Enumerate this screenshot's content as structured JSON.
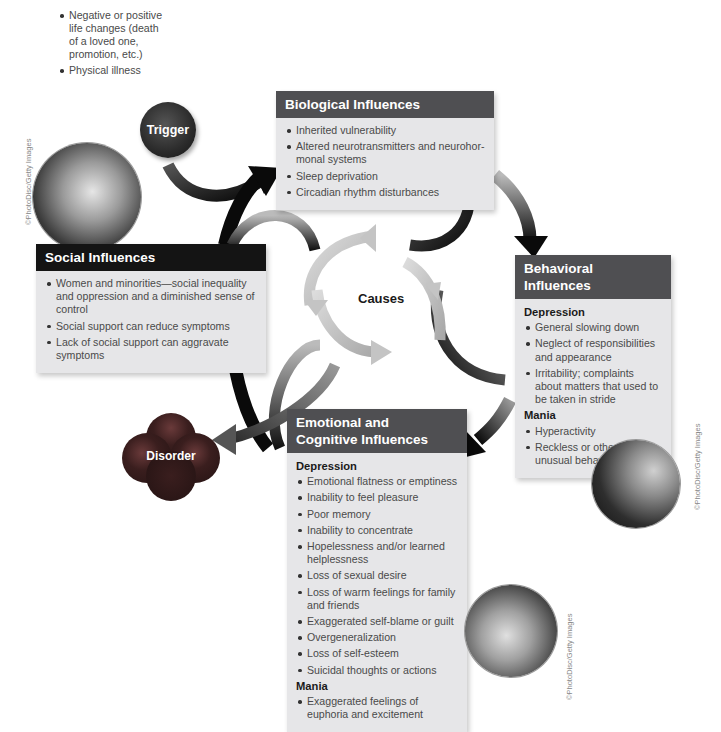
{
  "diagram": {
    "center_label": "Causes",
    "trigger": {
      "label": "Trigger",
      "items": [
        "Negative or positive life changes (death of a loved one, promotion, etc.)",
        "Physical illness"
      ]
    },
    "disorder": {
      "label": "Disorder"
    },
    "biological": {
      "title": "Biological Influences",
      "items": [
        "Inherited vulnerability",
        "Altered neurotransmitters and neurohor-monal systems",
        "Sleep deprivation",
        "Circadian rhythm disturbances"
      ]
    },
    "social": {
      "title": "Social Influences",
      "items": [
        "Women and minorities—social inequality and oppression and a diminished sense of control",
        "Social support can reduce symptoms",
        "Lack of social support can aggravate symptoms"
      ]
    },
    "behavioral": {
      "title": "Behavioral Influences",
      "depression_label": "Depression",
      "depression_items": [
        "General slowing down",
        "Neglect of responsibilities and appearance",
        "Irritability; complaints about matters that used to be taken in stride"
      ],
      "mania_label": "Mania",
      "mania_items": [
        "Hyperactivity",
        "Reckless or otherwise unusual behavior"
      ]
    },
    "emotional": {
      "title_line1": "Emotional and",
      "title_line2": "Cognitive Influences",
      "depression_label": "Depression",
      "depression_items": [
        "Emotional flatness or emptiness",
        "Inability to feel pleasure",
        "Poor memory",
        "Inability to concentrate",
        "Hopelessness and/or learned helplessness",
        "Loss of sexual desire",
        "Loss of warm feelings for family and friends",
        "Exaggerated self-blame or guilt",
        "Overgeneralization",
        "Loss of self-esteem",
        "Suicidal thoughts or actions"
      ],
      "mania_label": "Mania",
      "mania_items": [
        "Exaggerated feelings of euphoria and excitement"
      ]
    },
    "credits": {
      "social_photo": "©PhotoDisc/Getty Images",
      "behavioral_photo": "©PhotoDisc/Getty Images",
      "emotional_photo": "©PhotoDisc/Getty Images"
    },
    "colors": {
      "box_bg": "#e6e6e8",
      "head_gray": "#4f4f52",
      "head_black": "#141414",
      "arrow_dark": "#111111",
      "arrow_light": "#c4c4c4"
    }
  }
}
